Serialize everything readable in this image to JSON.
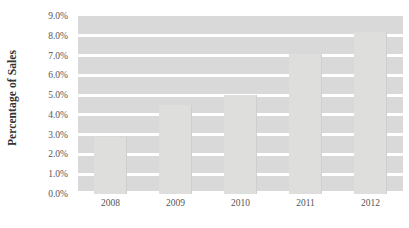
{
  "chart_data": {
    "type": "bar",
    "title": "",
    "subtitle": "",
    "xlabel": "",
    "ylabel": "Percentage of Sales",
    "categories": [
      "2008",
      "2009",
      "2010",
      "2011",
      "2012"
    ],
    "values": [
      2.9,
      4.5,
      5.0,
      7.1,
      8.2
    ],
    "series": [
      {
        "name": "Percentage of Sales",
        "values": [
          2.9,
          4.5,
          5.0,
          7.1,
          8.2
        ]
      }
    ],
    "ylim": [
      0.0,
      9.0
    ],
    "ytick_values": [
      0.0,
      1.0,
      2.0,
      3.0,
      4.0,
      5.0,
      6.0,
      7.0,
      8.0,
      9.0
    ],
    "ytick_labels": [
      "0.0%",
      "1.0%",
      "2.0%",
      "3.0%",
      "4.0%",
      "5.0%",
      "6.0%",
      "7.0%",
      "8.0%",
      "9.0%"
    ],
    "value_suffix": "%",
    "grid": true,
    "grid_orientation": "horizontal",
    "legend": false,
    "legend_position": "none",
    "annotations": [],
    "colors": {
      "plot_background": "#d9d9d9",
      "gridline": "#ffffff",
      "bar_fill": "#dededd",
      "bar_edge": "#cfcfcf",
      "page_background": "#ffffff",
      "axis_title_text": "#333333",
      "tick_text": "#555555"
    }
  }
}
